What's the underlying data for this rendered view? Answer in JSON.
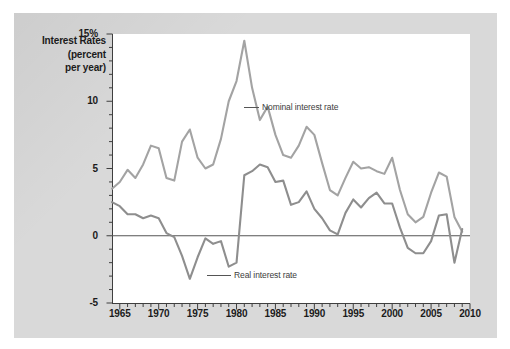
{
  "axis_title": {
    "line1": "Interest Rates",
    "line2": "(percent",
    "line3": "per year)"
  },
  "annotations": {
    "nominal": "Nominal interest rate",
    "real": "Real interest rate"
  },
  "colors": {
    "nominal_line": "#a3a3a3",
    "real_line": "#8e8e8e",
    "zero_line": "#555555",
    "axis": "#3f3f3f",
    "panel_bg": "#d9d9d9",
    "plot_bg": "#ffffff",
    "text": "#1b1b1b"
  },
  "chart_data": {
    "type": "line",
    "title": "Interest Rates (percent per year)",
    "xlabel": "",
    "ylabel": "Interest Rates (percent per year)",
    "xlim": [
      1964,
      2010
    ],
    "ylim": [
      -5,
      15
    ],
    "grid": false,
    "legend": "inline-annotations",
    "ytick_labels": [
      "-5",
      "0",
      "5",
      "10",
      "15%"
    ],
    "ytick_values": [
      -5,
      0,
      5,
      10,
      15
    ],
    "xtick_labels": [
      "1965",
      "1970",
      "1975",
      "1980",
      "1985",
      "1990",
      "1995",
      "2000",
      "2005",
      "2010"
    ],
    "xtick_values": [
      1965,
      1970,
      1975,
      1980,
      1985,
      1990,
      1995,
      2000,
      2005,
      2010
    ],
    "x": [
      1964,
      1965,
      1966,
      1967,
      1968,
      1969,
      1970,
      1971,
      1972,
      1973,
      1974,
      1975,
      1976,
      1977,
      1978,
      1979,
      1980,
      1981,
      1982,
      1983,
      1984,
      1985,
      1986,
      1987,
      1988,
      1989,
      1990,
      1991,
      1992,
      1993,
      1994,
      1995,
      1996,
      1997,
      1998,
      1999,
      2000,
      2001,
      2002,
      2003,
      2004,
      2005,
      2006,
      2007,
      2008,
      2009
    ],
    "series": [
      {
        "name": "Nominal interest rate",
        "color": "#a3a3a3",
        "values": [
          3.5,
          4.0,
          4.9,
          4.3,
          5.3,
          6.7,
          6.5,
          4.3,
          4.1,
          7.0,
          7.9,
          5.8,
          5.0,
          5.3,
          7.2,
          10.0,
          11.5,
          14.5,
          11.0,
          8.6,
          9.6,
          7.5,
          6.0,
          5.8,
          6.7,
          8.1,
          7.5,
          5.4,
          3.4,
          3.0,
          4.3,
          5.5,
          5.0,
          5.1,
          4.8,
          4.6,
          5.8,
          3.4,
          1.6,
          1.0,
          1.4,
          3.2,
          4.7,
          4.4,
          1.4,
          0.3
        ]
      },
      {
        "name": "Real interest rate",
        "color": "#8e8e8e",
        "values": [
          2.5,
          2.2,
          1.6,
          1.6,
          1.3,
          1.5,
          1.3,
          0.2,
          -0.1,
          -1.5,
          -3.2,
          -1.6,
          -0.2,
          -0.6,
          -0.4,
          -2.3,
          -2.0,
          4.5,
          4.8,
          5.3,
          5.1,
          4.0,
          4.1,
          2.3,
          2.5,
          3.3,
          2.0,
          1.3,
          0.4,
          0.1,
          1.7,
          2.7,
          2.1,
          2.8,
          3.2,
          2.4,
          2.4,
          0.6,
          -0.9,
          -1.3,
          -1.3,
          -0.4,
          1.5,
          1.6,
          -2.0,
          0.5
        ]
      }
    ]
  }
}
